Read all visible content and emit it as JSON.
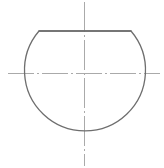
{
  "canvas": {
    "width": 164,
    "height": 168,
    "background_color": "#ffffff",
    "title": "Truncated circle outline with center lines"
  },
  "style": {
    "outline_color": "#6e6e6e",
    "outline_width": 1.3,
    "centerline_color": "#aaaaaa",
    "centerline_width": 1.0,
    "centerline_dash": "28 3 2 3"
  },
  "geometry": {
    "circle": {
      "center_x": 84.5,
      "center_y": 73,
      "radius": 60.5
    },
    "flat_top": {
      "y": 31,
      "x_start": 39,
      "x_end": 131,
      "label": "chord cut at top of circle"
    },
    "horizontal_centerline": {
      "y": 73,
      "x_start": 8,
      "x_end": 160
    },
    "vertical_centerline": {
      "x": 84.5,
      "y_start": 2,
      "y_end": 166
    },
    "outline_path": "M 39 31 L 131 31 A 60.5 60.5 0 1 1 39 31 Z"
  },
  "chart_data": {
    "type": "line",
    "title": "Truncated circle outline with center lines",
    "xlabel": "",
    "ylabel": "",
    "xlim": [
      0,
      164
    ],
    "ylim": [
      0,
      168
    ],
    "grid": false,
    "legend": "none",
    "series": [
      {
        "name": "outline",
        "description": "Circle of radius 60.5 centered at (84.5, 73) truncated by a horizontal chord at y = 31",
        "x": [
          39,
          131
        ],
        "values": [
          31,
          31
        ]
      },
      {
        "name": "horizontal-centerline",
        "description": "Dash-dot horizontal center line",
        "x": [
          8,
          160
        ],
        "values": [
          73,
          73
        ]
      },
      {
        "name": "vertical-centerline",
        "description": "Dash-dot vertical center line",
        "x": [
          84.5,
          84.5
        ],
        "values": [
          2,
          166
        ]
      }
    ]
  }
}
